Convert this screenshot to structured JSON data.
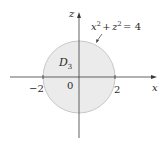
{
  "diagram": {
    "equation": {
      "base_x": "x",
      "sup_x": "2",
      "plus": "+",
      "base_z": "z",
      "sup_z": "2",
      "rhs": "= 4"
    },
    "region_label": {
      "main": "D",
      "sub": "3"
    },
    "axes": {
      "horizontal": "x",
      "vertical": "z"
    },
    "ticks": {
      "neg": "−2",
      "origin": "0",
      "pos": "2"
    },
    "colors": {
      "fill": "#ebebeb",
      "stroke": "#c8c8c8",
      "axis": "#3a3a3a",
      "text": "#2a2a2a"
    }
  }
}
